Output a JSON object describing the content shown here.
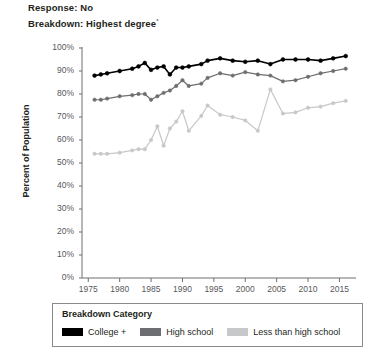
{
  "header": {
    "line1": "Response: No",
    "line2": "Breakdown: Highest degree",
    "line2_superscript": "°"
  },
  "legend": {
    "title": "Breakdown Category",
    "items": [
      {
        "label": "College +",
        "color": "#000000"
      },
      {
        "label": "High school",
        "color": "#6d6e71"
      },
      {
        "label": "Less than high school",
        "color": "#c7c8ca"
      }
    ]
  },
  "chart_data": {
    "type": "line",
    "xlabel": "",
    "ylabel": "Percent of Population",
    "xlim": [
      1974,
      2017
    ],
    "ylim": [
      0,
      100
    ],
    "xticks": [
      1975,
      1980,
      1985,
      1990,
      1995,
      2000,
      2005,
      2010,
      2015
    ],
    "yticks": [
      0,
      10,
      20,
      30,
      40,
      50,
      60,
      70,
      80,
      90,
      100
    ],
    "ytick_labels": [
      "0%",
      "10%",
      "20%",
      "30%",
      "40%",
      "50%",
      "60%",
      "70%",
      "80%",
      "90%",
      "100%"
    ],
    "xtick_labels": [
      "1975",
      "1980",
      "1985",
      "1990",
      "1995",
      "2000",
      "2005",
      "2010",
      "2015"
    ],
    "grid": false,
    "legend_position": "bottom",
    "markers": true,
    "x": [
      1976,
      1977,
      1978,
      1980,
      1982,
      1983,
      1984,
      1985,
      1986,
      1987,
      1988,
      1989,
      1990,
      1991,
      1993,
      1994,
      1996,
      1998,
      2000,
      2002,
      2004,
      2006,
      2008,
      2010,
      2012,
      2014,
      2016
    ],
    "series": [
      {
        "name": "College +",
        "color": "#000000",
        "values": [
          88,
          88.5,
          89,
          90,
          91,
          92,
          93.5,
          90.5,
          91.5,
          92,
          88.5,
          91.5,
          91.5,
          92,
          93,
          94.5,
          95.5,
          94.5,
          94,
          94.5,
          93,
          95,
          95,
          95,
          94.5,
          95.5,
          96.5
        ]
      },
      {
        "name": "High school",
        "color": "#6d6e71",
        "values": [
          77.5,
          77.5,
          78,
          79,
          79.5,
          80,
          80,
          77.5,
          79,
          80.5,
          81.5,
          83.5,
          86,
          83.5,
          84.5,
          87,
          89,
          88,
          89.5,
          88.5,
          88,
          85.5,
          86,
          87.5,
          89,
          90,
          91
        ]
      },
      {
        "name": "Less than high school",
        "color": "#c7c8ca",
        "values": [
          54,
          54,
          54,
          54.5,
          55.5,
          56,
          56,
          60,
          66,
          57.5,
          65,
          68,
          72.5,
          64,
          70.5,
          75,
          71,
          70,
          68.5,
          64,
          82,
          71.5,
          72,
          74,
          74.5,
          76,
          77
        ]
      }
    ]
  }
}
